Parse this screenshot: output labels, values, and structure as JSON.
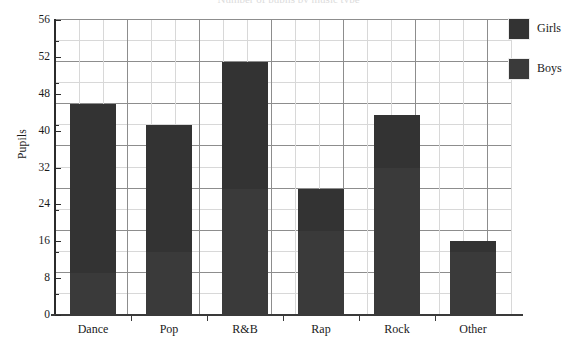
{
  "chart_data": {
    "type": "bar",
    "subtype": "stacked-vertical",
    "title": "Number of pupils by music type",
    "xlabel": "",
    "ylabel": "Pupils",
    "categories": [
      "Dance",
      "Pop",
      "R&B",
      "Rap",
      "Rock",
      "Other"
    ],
    "series": [
      {
        "name": "Boys",
        "color": "#3a3a3a",
        "values": [
          8,
          12,
          24,
          16,
          28,
          12
        ]
      },
      {
        "name": "Girls",
        "color": "#333333",
        "values": [
          32,
          24,
          24,
          8,
          10,
          2
        ]
      }
    ],
    "totals": [
      40,
      36,
      48,
      24,
      38,
      14
    ],
    "ylim": [
      0,
      56
    ],
    "y_major_step": 8,
    "y_minor_step": 4,
    "y_tick_labels": [
      "56",
      "52",
      "48",
      "40",
      "32",
      "24",
      "16",
      "8",
      "0"
    ],
    "y_tick_values": [
      56,
      48,
      40,
      32,
      24,
      16,
      8,
      4,
      0
    ],
    "grid": "both",
    "legend_position": "right-top",
    "legend_entries": [
      "Girls",
      "Boys"
    ]
  },
  "axes": {
    "y_title": "Pupils",
    "y_labels": [
      "56",
      "52",
      "48",
      "40",
      "32",
      "24",
      "16",
      "8",
      "0"
    ],
    "x_labels": [
      "Dance",
      "Pop",
      "R&B",
      "Rap",
      "Rock",
      "Other"
    ]
  },
  "legend": {
    "rows": [
      {
        "label": "Girls",
        "color": "#333333"
      },
      {
        "label": "Boys",
        "color": "#3a3a3a"
      }
    ]
  },
  "colors": {
    "girls": "#333333",
    "boys": "#3a3a3a",
    "axis": "#2b2b2b",
    "grid_major": "#8d8d8d",
    "grid_minor": "#d8d8d8",
    "background": "#ffffff"
  }
}
